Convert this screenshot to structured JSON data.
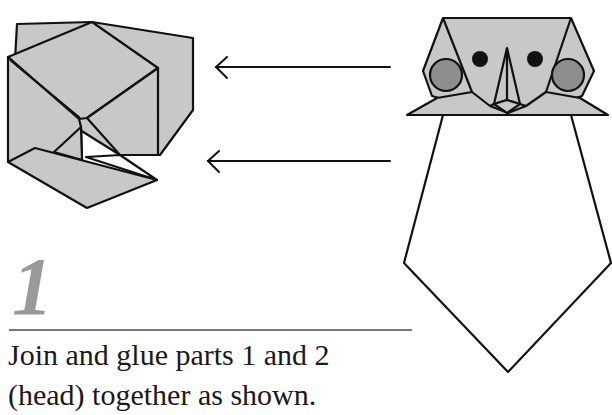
{
  "page": {
    "type": "craft-instruction-step",
    "colors": {
      "paper_fill": "#c8c8c8",
      "cheek_fill": "#8e8e8e",
      "outline": "#111111",
      "step_number": "#9a9a9a",
      "rule": "#7a7a7a",
      "text": "#1a1a1a"
    }
  },
  "diagram": {
    "left_part": {
      "label": "folded-head-part",
      "fill": "#c8c8c8"
    },
    "arrows": [
      {
        "id": "arrow-top",
        "direction": "left"
      },
      {
        "id": "arrow-bottom",
        "direction": "left"
      }
    ],
    "right_part": {
      "label": "owl-head-and-body",
      "eyes": 2,
      "cheeks": 2
    }
  },
  "step": {
    "number": "1",
    "instruction_line1": "Join and glue parts 1 and 2",
    "instruction_line2": "(head) together as shown."
  }
}
